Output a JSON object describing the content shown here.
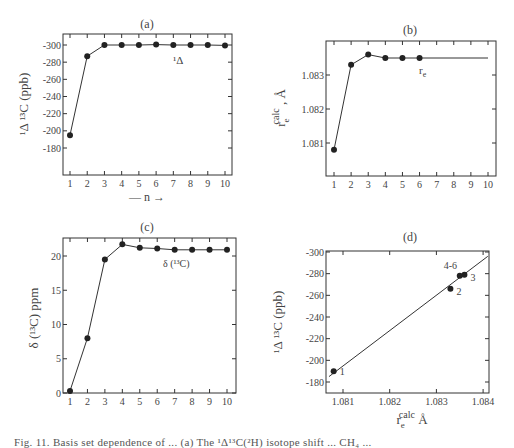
{
  "figure": {
    "caption": "Fig. 11. Basis set dependence of ... (a) The ¹Δ¹³C(²H) isotope shift ... CH₄ ..."
  },
  "chart_data": [
    {
      "id": "a",
      "type": "line",
      "title": "(a)",
      "xlabel": "— n →",
      "ylabel": "¹Δ ¹³C (ppb)",
      "x": [
        1,
        2,
        3,
        4,
        5,
        6,
        7,
        8,
        9,
        10
      ],
      "series": [
        {
          "name": "¹Δ",
          "values": [
            -195,
            -287,
            -300,
            -300,
            -300,
            -300.5,
            -300,
            -300,
            -300,
            -299.5
          ]
        }
      ],
      "xticks": [
        "1",
        "2",
        "3",
        "4",
        "5",
        "6",
        "7",
        "8",
        "9",
        "10"
      ],
      "yticks": [
        -300,
        -280,
        -260,
        -240,
        -220,
        -200,
        -180
      ],
      "ylim": [
        -300,
        -180
      ],
      "y_inverted": true,
      "annotation": "¹Δ",
      "grid": false
    },
    {
      "id": "b",
      "type": "line",
      "title": "(b)",
      "xlabel": "",
      "ylabel": "r_e^calc , Å",
      "x": [
        1,
        2,
        3,
        4,
        5,
        6
      ],
      "series": [
        {
          "name": "r_e",
          "values": [
            1.0808,
            1.0833,
            1.0836,
            1.0835,
            1.0835,
            1.0835
          ]
        }
      ],
      "extension": {
        "from_x": 6,
        "to_x": 10,
        "value": 1.0835
      },
      "xticks": [
        "1",
        "2",
        "3",
        "4",
        "5",
        "6",
        "7",
        "8",
        "9",
        "10"
      ],
      "yticks": [
        1.081,
        1.082,
        1.083
      ],
      "ylim": [
        1.08,
        1.084
      ],
      "annotation": "r_e",
      "grid": false
    },
    {
      "id": "c",
      "type": "line",
      "title": "(c)",
      "xlabel": "",
      "ylabel": "δ (¹³C) ppm",
      "x": [
        1,
        2,
        3,
        4,
        5,
        6,
        7,
        8,
        9,
        10
      ],
      "series": [
        {
          "name": "δ (¹³C)",
          "values": [
            0.3,
            8.0,
            19.5,
            21.7,
            21.2,
            21.1,
            20.9,
            20.9,
            20.9,
            20.9
          ]
        }
      ],
      "xticks": [
        "1",
        "2",
        "3",
        "4",
        "5",
        "6",
        "7",
        "8",
        "9",
        "10"
      ],
      "yticks": [
        0,
        5,
        10,
        15,
        20
      ],
      "ylim": [
        0,
        22.5
      ],
      "annotation": "δ (¹³C)",
      "grid": false
    },
    {
      "id": "d",
      "type": "scatter",
      "title": "(d)",
      "xlabel": "r_e^calc Å",
      "ylabel": "¹Δ ¹³C (ppb)",
      "points": [
        {
          "label": "1",
          "x": 1.0808,
          "y": -190
        },
        {
          "label": "2",
          "x": 1.0833,
          "y": -266
        },
        {
          "label": "3",
          "x": 1.0836,
          "y": -279
        },
        {
          "label": "4-6",
          "x": 1.0835,
          "y": -278
        }
      ],
      "fit_line": {
        "x1": 1.0807,
        "y1": -185,
        "x2": 1.0841,
        "y2": -296
      },
      "xticks": [
        1.081,
        1.082,
        1.083,
        1.084
      ],
      "yticks": [
        -300,
        -280,
        -260,
        -240,
        -220,
        -200,
        -180
      ],
      "xlim": [
        1.0806,
        1.0841
      ],
      "ylim": [
        -300,
        -170
      ],
      "y_inverted": true,
      "grid": false
    }
  ]
}
